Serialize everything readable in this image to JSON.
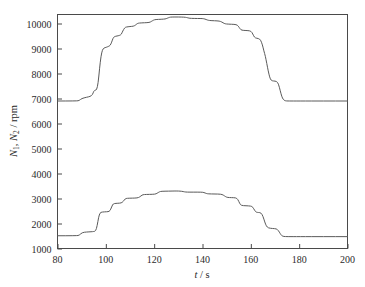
{
  "figure": {
    "background": "#ffffff",
    "line_color": "#5a5a5a",
    "axis_color": "#4a4a4a",
    "width": 365,
    "height": 287
  },
  "axes": {
    "x_title_var": "t",
    "x_title_slash": "/",
    "x_title_unit": "s",
    "y_title_var1": "N",
    "y_title_sub1": "1",
    "y_title_comma": ", ",
    "y_title_var2": "N",
    "y_title_sub2": "2",
    "y_title_slash": "/",
    "y_title_unit": "rpm",
    "x_ticks": [
      "80",
      "100",
      "120",
      "140",
      "160",
      "180",
      "200"
    ],
    "y_ticks": [
      "1000",
      "2000",
      "3000",
      "4000",
      "5000",
      "6000",
      "7000",
      "8000",
      "9000",
      "10000"
    ]
  },
  "chart_data": {
    "type": "line",
    "title": "",
    "xlabel": "t / s",
    "ylabel": "N1, N2 / rpm",
    "xlim": [
      80,
      200
    ],
    "ylim": [
      1000,
      10400
    ],
    "grid": false,
    "legend": null,
    "x_tick_values": [
      80,
      100,
      120,
      140,
      160,
      180,
      200
    ],
    "y_tick_values": [
      1000,
      2000,
      3000,
      4000,
      5000,
      6000,
      7000,
      8000,
      9000,
      10000
    ],
    "series": [
      {
        "name": "N1",
        "color": "#5a5a5a",
        "points": [
          [
            80.0,
            6900
          ],
          [
            88.0,
            6900
          ],
          [
            89.0,
            6920
          ],
          [
            90.0,
            7000
          ],
          [
            92.0,
            7050
          ],
          [
            93.5,
            7080
          ],
          [
            94.5,
            7150
          ],
          [
            95.0,
            7300
          ],
          [
            95.6,
            7330
          ],
          [
            96.2,
            7350
          ],
          [
            96.8,
            7600
          ],
          [
            97.4,
            8200
          ],
          [
            98.0,
            8700
          ],
          [
            98.6,
            8950
          ],
          [
            99.2,
            9020
          ],
          [
            100.2,
            9050
          ],
          [
            101.0,
            9080
          ],
          [
            101.8,
            9120
          ],
          [
            102.4,
            9250
          ],
          [
            103.0,
            9420
          ],
          [
            103.6,
            9480
          ],
          [
            104.6,
            9500
          ],
          [
            105.6,
            9520
          ],
          [
            106.4,
            9560
          ],
          [
            107.0,
            9700
          ],
          [
            107.8,
            9830
          ],
          [
            108.4,
            9860
          ],
          [
            110.0,
            9880
          ],
          [
            111.4,
            9890
          ],
          [
            112.2,
            9930
          ],
          [
            113.0,
            10000
          ],
          [
            113.8,
            10020
          ],
          [
            116.0,
            10030
          ],
          [
            118.0,
            10040
          ],
          [
            118.8,
            10080
          ],
          [
            119.8,
            10140
          ],
          [
            120.6,
            10160
          ],
          [
            123.0,
            10170
          ],
          [
            124.6,
            10180
          ],
          [
            125.4,
            10210
          ],
          [
            126.4,
            10250
          ],
          [
            127.2,
            10260
          ],
          [
            130.0,
            10260
          ],
          [
            132.4,
            10255
          ],
          [
            133.4,
            10240
          ],
          [
            134.4,
            10215
          ],
          [
            135.2,
            10205
          ],
          [
            138.0,
            10200
          ],
          [
            140.0,
            10200
          ],
          [
            141.0,
            10180
          ],
          [
            142.0,
            10140
          ],
          [
            142.8,
            10120
          ],
          [
            145.0,
            10110
          ],
          [
            147.0,
            10100
          ],
          [
            148.0,
            10060
          ],
          [
            149.0,
            10000
          ],
          [
            149.8,
            9980
          ],
          [
            152.0,
            9970
          ],
          [
            154.0,
            9960
          ],
          [
            154.8,
            9900
          ],
          [
            155.6,
            9780
          ],
          [
            156.2,
            9730
          ],
          [
            158.0,
            9720
          ],
          [
            159.6,
            9710
          ],
          [
            160.4,
            9660
          ],
          [
            161.2,
            9500
          ],
          [
            161.8,
            9420
          ],
          [
            163.2,
            9400
          ],
          [
            164.0,
            9350
          ],
          [
            164.8,
            9150
          ],
          [
            165.4,
            8900
          ],
          [
            166.0,
            8700
          ],
          [
            166.6,
            8400
          ],
          [
            167.2,
            8100
          ],
          [
            167.8,
            7850
          ],
          [
            168.4,
            7720
          ],
          [
            169.4,
            7700
          ],
          [
            170.6,
            7690
          ],
          [
            171.4,
            7600
          ],
          [
            172.2,
            7300
          ],
          [
            172.8,
            7080
          ],
          [
            173.4,
            6960
          ],
          [
            174.2,
            6905
          ],
          [
            175.5,
            6900
          ],
          [
            180.0,
            6900
          ],
          [
            190.0,
            6900
          ],
          [
            200.0,
            6900
          ]
        ]
      },
      {
        "name": "N2",
        "color": "#5a5a5a",
        "points": [
          [
            80.0,
            1510
          ],
          [
            88.0,
            1510
          ],
          [
            89.0,
            1530
          ],
          [
            90.2,
            1640
          ],
          [
            92.0,
            1660
          ],
          [
            94.0,
            1670
          ],
          [
            95.0,
            1680
          ],
          [
            95.8,
            1700
          ],
          [
            96.4,
            1900
          ],
          [
            97.0,
            2250
          ],
          [
            97.6,
            2430
          ],
          [
            98.4,
            2460
          ],
          [
            100.4,
            2470
          ],
          [
            101.4,
            2480
          ],
          [
            102.0,
            2560
          ],
          [
            102.8,
            2760
          ],
          [
            103.4,
            2800
          ],
          [
            105.0,
            2810
          ],
          [
            106.4,
            2820
          ],
          [
            107.2,
            2880
          ],
          [
            108.0,
            2990
          ],
          [
            108.8,
            3010
          ],
          [
            111.0,
            3015
          ],
          [
            113.0,
            3020
          ],
          [
            114.0,
            3060
          ],
          [
            115.0,
            3140
          ],
          [
            115.8,
            3160
          ],
          [
            118.0,
            3165
          ],
          [
            120.4,
            3170
          ],
          [
            121.2,
            3210
          ],
          [
            122.2,
            3270
          ],
          [
            123.0,
            3290
          ],
          [
            126.0,
            3295
          ],
          [
            128.8,
            3300
          ],
          [
            130.0,
            3300
          ],
          [
            131.4,
            3290
          ],
          [
            132.6,
            3265
          ],
          [
            133.6,
            3255
          ],
          [
            136.0,
            3255
          ],
          [
            139.6,
            3255
          ],
          [
            140.6,
            3240
          ],
          [
            141.6,
            3200
          ],
          [
            142.4,
            3185
          ],
          [
            145.0,
            3180
          ],
          [
            147.6,
            3175
          ],
          [
            148.6,
            3140
          ],
          [
            149.6,
            3070
          ],
          [
            150.4,
            3040
          ],
          [
            152.0,
            3035
          ],
          [
            153.8,
            3030
          ],
          [
            154.6,
            2970
          ],
          [
            155.4,
            2800
          ],
          [
            156.0,
            2720
          ],
          [
            158.0,
            2710
          ],
          [
            160.0,
            2700
          ],
          [
            160.8,
            2660
          ],
          [
            161.6,
            2520
          ],
          [
            162.2,
            2450
          ],
          [
            163.2,
            2440
          ],
          [
            164.2,
            2430
          ],
          [
            165.0,
            2300
          ],
          [
            165.8,
            2050
          ],
          [
            166.4,
            1900
          ],
          [
            167.2,
            1820
          ],
          [
            169.0,
            1800
          ],
          [
            170.6,
            1790
          ],
          [
            171.4,
            1720
          ],
          [
            172.2,
            1590
          ],
          [
            172.8,
            1510
          ],
          [
            173.6,
            1480
          ],
          [
            175.0,
            1475
          ],
          [
            180.0,
            1475
          ],
          [
            190.0,
            1475
          ],
          [
            200.0,
            1475
          ]
        ]
      }
    ]
  }
}
